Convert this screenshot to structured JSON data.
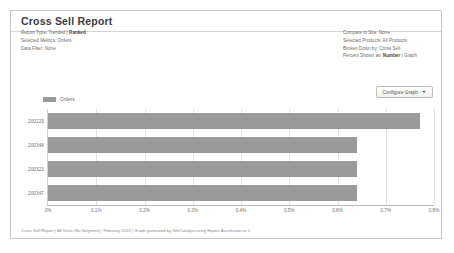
{
  "panel": {
    "title": "Cross Sell Report"
  },
  "meta_left": [
    {
      "label": "Report Type: Trended | ",
      "strong": "Ranked",
      "after": ""
    },
    {
      "label": "Selected Metrics: Orders",
      "strong": "",
      "after": ""
    },
    {
      "label": "Data Filter: None",
      "strong": "",
      "after": ""
    }
  ],
  "meta_right": [
    {
      "label": "Compare to Site: None",
      "strong": "",
      "after": ""
    },
    {
      "label": "Selected Products: All Products",
      "strong": "",
      "after": ""
    },
    {
      "label": "Broken Down by: Cross Sell",
      "strong": "",
      "after": ""
    },
    {
      "label": "Percent Shown as: ",
      "strong": "Number",
      "after": " | Graph"
    }
  ],
  "toolbar": {
    "configure_graph_label": "Configure Graph",
    "caret_icon": "chevron-down-icon"
  },
  "footer": {
    "text": "Cross Sell Report | All Visits (No Segment) | February 2013 | Graph generated by SiteCatalyst using Report Accelerator at 1."
  },
  "chart_data": {
    "type": "bar",
    "orientation": "horizontal",
    "title": "",
    "xlabel": "",
    "ylabel": "",
    "series": [
      {
        "name": "Orders",
        "color": "#9a9a9a",
        "values": [
          0.77,
          0.64,
          0.64,
          0.64
        ]
      }
    ],
    "categories": [
      "200229",
      "200348",
      "200323",
      "200347"
    ],
    "xlim": [
      0,
      0.8
    ],
    "xticks": [
      0,
      0.1,
      0.2,
      0.3,
      0.4,
      0.5,
      0.6,
      0.7,
      0.8
    ],
    "xtick_labels": [
      "0%",
      "0.1%",
      "0.2%",
      "0.3%",
      "0.4%",
      "0.5%",
      "0.6%",
      "0.7%",
      "0.8%"
    ],
    "grid": true,
    "legend": {
      "position": "top-left",
      "entries": [
        "Orders"
      ]
    }
  }
}
